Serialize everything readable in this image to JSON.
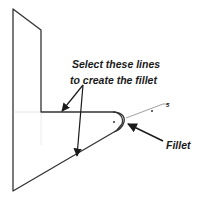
{
  "diagram": {
    "callouts": {
      "select_line1": "Select these lines",
      "select_line2": "to create the fillet",
      "fillet": "Fillet",
      "dimension_mark": "5"
    },
    "colors": {
      "line": "#333333",
      "arrow": "#1a1a1a",
      "construction": "#dddddd",
      "background": "#ffffff"
    }
  }
}
